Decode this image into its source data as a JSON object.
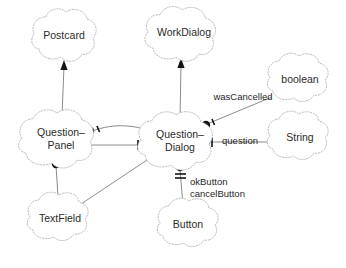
{
  "diagram": {
    "kind": "uml-object-diagram",
    "background_color": "#ffffff",
    "node_outline_color": "#b9b9b9",
    "edge_color": "#8a8a8a",
    "marker_color": "#141414",
    "text_color": "#2b2b2b",
    "nodes": [
      {
        "id": "postcard",
        "label": "Postcard",
        "cx": 64,
        "cy": 36,
        "rx": 34,
        "ry": 25
      },
      {
        "id": "workdialog",
        "label": "WorkDialog",
        "cx": 184,
        "cy": 33,
        "rx": 40,
        "ry": 25
      },
      {
        "id": "boolean",
        "label": "boolean",
        "cx": 300,
        "cy": 80,
        "rx": 36,
        "ry": 25
      },
      {
        "id": "questionpanel",
        "label_line1": "Question–",
        "label_line2": "Panel",
        "cx": 61,
        "cy": 139,
        "rx": 42,
        "ry": 27
      },
      {
        "id": "questiondialog",
        "label_line1": "Question–",
        "label_line2": "Dialog",
        "cx": 180,
        "cy": 141,
        "rx": 42,
        "ry": 27
      },
      {
        "id": "string",
        "label": "String",
        "cx": 300,
        "cy": 138,
        "rx": 36,
        "ry": 25
      },
      {
        "id": "textfield",
        "label": "TextField",
        "cx": 60,
        "cy": 219,
        "rx": 36,
        "ry": 25
      },
      {
        "id": "button",
        "label": "Button",
        "cx": 188,
        "cy": 225,
        "rx": 34,
        "ry": 25
      }
    ],
    "edge_labels": [
      {
        "id": "wascancelled",
        "text": "wasCancelled",
        "x": 243,
        "y": 97
      },
      {
        "id": "question",
        "text": "question",
        "x": 240,
        "y": 141
      },
      {
        "id": "okbutton",
        "text": "okButton",
        "x": 216,
        "y": 182
      },
      {
        "id": "cancelbutton",
        "text": "cancelButton",
        "x": 222,
        "y": 194
      }
    ],
    "edges": [
      {
        "id": "postcard-questionpanel",
        "type": "generalization",
        "from": "questionpanel",
        "to": "postcard"
      },
      {
        "id": "workdialog-questiondialog",
        "type": "generalization",
        "from": "questiondialog",
        "to": "workdialog"
      },
      {
        "id": "questionpanel-questiondialog-curved",
        "type": "association",
        "from": "questiondialog",
        "to": "questionpanel"
      },
      {
        "id": "questionpanel-questiondialog-straight",
        "type": "association",
        "from": "questionpanel",
        "to": "questiondialog"
      },
      {
        "id": "questiondialog-boolean",
        "type": "association",
        "from": "questiondialog",
        "to": "boolean",
        "label": "wasCancelled"
      },
      {
        "id": "questiondialog-string",
        "type": "association",
        "from": "questiondialog",
        "to": "string",
        "label": "question"
      },
      {
        "id": "questiondialog-button",
        "type": "association",
        "from": "questiondialog",
        "to": "button",
        "label": "okButton cancelButton"
      },
      {
        "id": "questionpanel-textfield",
        "type": "association",
        "from": "questionpanel",
        "to": "textfield"
      },
      {
        "id": "questiondialog-textfield",
        "type": "association",
        "from": "questiondialog",
        "to": "textfield"
      }
    ]
  }
}
